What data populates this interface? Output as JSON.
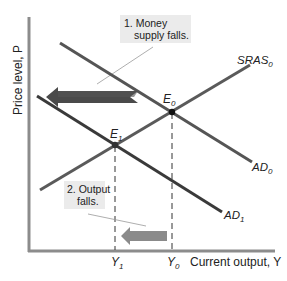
{
  "diagram": {
    "title": "",
    "axes": {
      "y_label": "Price level, P",
      "x_label": "Current output, Y"
    },
    "curves": [
      {
        "id": "AD0",
        "label": "AD",
        "subscript": "0",
        "color": "#555555"
      },
      {
        "id": "SRAS0",
        "label": "SRAS",
        "subscript": "0",
        "color": "#555555"
      },
      {
        "id": "AD1",
        "label": "AD",
        "subscript": "1",
        "color": "#3a3a3a"
      }
    ],
    "points": [
      {
        "id": "E0",
        "label": "E",
        "subscript": "0"
      },
      {
        "id": "E1",
        "label": "E",
        "subscript": "1"
      }
    ],
    "x_ticks": [
      {
        "label": "Y",
        "subscript": "1"
      },
      {
        "label": "Y",
        "subscript": "0"
      }
    ],
    "annotations": [
      {
        "line1": "1. Money",
        "line2": "supply falls."
      },
      {
        "line1": "2. Output",
        "line2": "falls."
      }
    ],
    "arrows": [
      {
        "id": "ad-shift-arrow",
        "direction": "left",
        "color": "#4a4a4a"
      },
      {
        "id": "output-fall-arrow",
        "direction": "left",
        "color": "#8a8a8a"
      }
    ],
    "colors": {
      "axis": "#8c8c8c",
      "curve": "#555555",
      "point": "#111111",
      "annotation_bg": "#ebebeb"
    }
  }
}
